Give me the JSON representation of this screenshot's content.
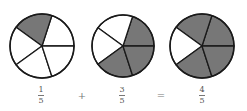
{
  "colors": {
    "shaded": "#777777",
    "unshaded": "#ffffff",
    "stroke": "#1a1a1a",
    "text": "#555555"
  },
  "pies": [
    {
      "name": "pie-one-fifth",
      "cx": 42,
      "cy": 46,
      "r": 32,
      "slices": 5,
      "shaded_slices": [
        1
      ]
    },
    {
      "name": "pie-three-fifths",
      "cx": 123,
      "cy": 46,
      "r": 31,
      "slices": 5,
      "shaded_slices": [
        0,
        3,
        4
      ]
    },
    {
      "name": "pie-four-fifths",
      "cx": 202,
      "cy": 46,
      "r": 32,
      "slices": 5,
      "shaded_slices": [
        0,
        1,
        3,
        4
      ]
    }
  ],
  "equation": {
    "term1": {
      "numerator": "1",
      "denominator": "5"
    },
    "plus": "+",
    "term2": {
      "numerator": "3",
      "denominator": "5"
    },
    "equals": "=",
    "result": {
      "numerator": "4",
      "denominator": "5"
    }
  }
}
